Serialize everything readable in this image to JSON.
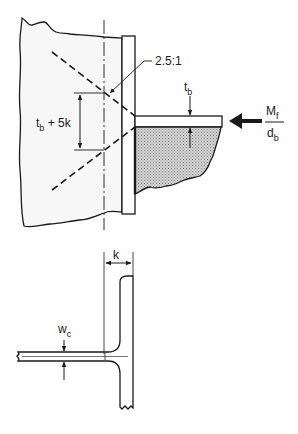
{
  "diagram": {
    "colors": {
      "ink": "#1a1a1a",
      "column_fill": "#f5f5f5",
      "hatch_fill": "#bdbdbd",
      "background": "#ffffff"
    },
    "top_view": {
      "slope_label": "2.5:1",
      "zone_label_main": "t",
      "zone_label_sub": "b",
      "zone_label_rest": " + 5k",
      "flange_thickness_main": "t",
      "flange_thickness_sub": "b",
      "force_numerator_main": "M",
      "force_numerator_sub": "f",
      "force_denominator_main": "d",
      "force_denominator_sub": "b",
      "arrow_direction": "left"
    },
    "bottom_view": {
      "k_label": "k",
      "web_thickness_main": "w",
      "web_thickness_sub": "c"
    }
  }
}
